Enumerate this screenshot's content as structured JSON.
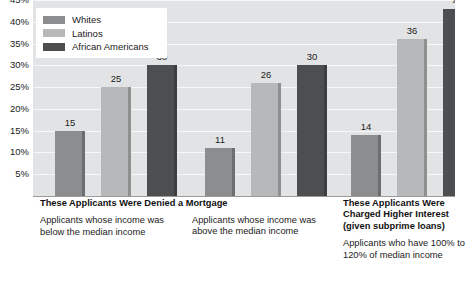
{
  "clipped_title": "Mortgage Lending Disparity by Race and Income",
  "legend": {
    "items": [
      {
        "label": "Whites",
        "color": "#8b8d8f"
      },
      {
        "label": "Latinos",
        "color": "#b6b8b9"
      },
      {
        "label": "African Americans",
        "color": "#4c4e50"
      }
    ]
  },
  "y_axis": {
    "ticks": [
      "45%",
      "40%",
      "35%",
      "30%",
      "25%",
      "20%",
      "15%",
      "10%",
      "5%"
    ]
  },
  "captions": [
    {
      "head": "These Applicants Were Denied a Mortgage",
      "sub": "Applicants whose income was below the median income"
    },
    {
      "head": "",
      "sub": "Applicants whose income was above the median income"
    },
    {
      "head": "These Applicants Were Charged Higher Interest (given subprime loans)",
      "sub": "Applicants who have 100% to 120% of median income"
    }
  ],
  "chart_data": {
    "type": "bar",
    "title": "Mortgage Lending Disparity by Race and Income",
    "xlabel": "",
    "ylabel": "",
    "ylim": [
      0,
      45
    ],
    "ytick_step": 5,
    "grid": true,
    "legend_position": "top-left",
    "categories": [
      "Applicants whose income was below the median income",
      "Applicants whose income was above the median income",
      "Applicants who have 100% to 120% of median income"
    ],
    "series": [
      {
        "name": "Whites",
        "color": "#8b8d8f",
        "values": [
          15,
          11,
          14
        ]
      },
      {
        "name": "Latinos",
        "color": "#b6b8b9",
        "values": [
          25,
          26,
          36
        ]
      },
      {
        "name": "African Americans",
        "color": "#4c4e50",
        "values": [
          30,
          30,
          43
        ]
      }
    ],
    "value_labels": [
      15,
      25,
      30,
      11,
      26,
      30,
      14,
      36,
      43
    ]
  },
  "colors": {
    "plot_background": "#e2e3e4",
    "gridline": "#f7f7f7",
    "baseline": "#9a9c9e",
    "text": "#1a1a1a"
  }
}
